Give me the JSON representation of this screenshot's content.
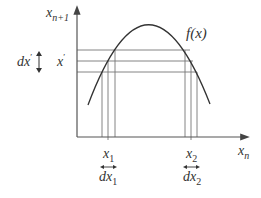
{
  "diagram": {
    "type": "logistic-map-sensitivity",
    "colors": {
      "axis": "#555555",
      "curve": "#333333",
      "grid": "#777777",
      "text": "#333333",
      "background": "#ffffff"
    },
    "axes": {
      "y_label": "x",
      "y_label_sub": "n+1",
      "x_label": "x",
      "x_label_sub": "n"
    },
    "curve_label": "f(x)",
    "left_labels": {
      "dx_prime": "dx",
      "dx_prime_mark": "′",
      "x_prime": "x",
      "x_prime_mark": "′"
    },
    "bottom_labels": [
      {
        "name": "x1",
        "text": "x",
        "sub": "1",
        "d_text": "dx",
        "d_sub": "1"
      },
      {
        "name": "x2",
        "text": "x",
        "sub": "2",
        "d_text": "dx",
        "d_sub": "2"
      }
    ],
    "horizontal_lines_y": [
      50,
      61,
      72
    ],
    "vertical_lines_left_x": [
      103,
      108,
      115
    ],
    "vertical_lines_right_x": [
      185,
      191,
      197
    ]
  }
}
